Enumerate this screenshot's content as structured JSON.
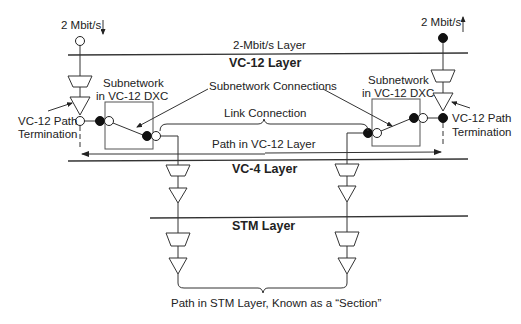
{
  "diagram": {
    "type": "SDH transport layer model",
    "inputs": {
      "left_rate": "2 Mbit/s",
      "right_rate": "2 Mbit/s"
    },
    "layers": [
      {
        "id": "layer-2mbit",
        "label": "2-Mbit/s Layer",
        "bold": false
      },
      {
        "id": "layer-vc12",
        "label": "VC-12 Layer",
        "bold": true
      },
      {
        "id": "layer-vc4",
        "label": "VC-4 Layer",
        "bold": true
      },
      {
        "id": "layer-stm",
        "label": "STM Layer",
        "bold": true
      }
    ],
    "annotations": {
      "subnetwork_left_line1": "Subnetwork",
      "subnetwork_left_line2": "in VC-12 DXC",
      "subnetwork_right_line1": "Subnetwork",
      "subnetwork_right_line2": "in VC-12 DXC",
      "subnetwork_connections": "Subnetwork Connections",
      "link_connection": "Link Connection",
      "path_vc12": "Path in VC-12 Layer",
      "left_termination_line1": "VC-12 Path",
      "left_termination_line2": "Termination",
      "right_termination_line1": "VC-12 Path",
      "right_termination_line2": "Termination",
      "stm_section": "Path in STM Layer, Known as a “Section”"
    }
  }
}
